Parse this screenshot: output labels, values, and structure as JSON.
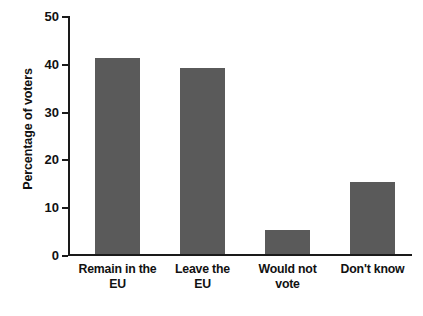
{
  "chart_data": {
    "type": "bar",
    "title": "",
    "xlabel": "",
    "ylabel": "Percentage of voters",
    "categories": [
      "Remain in the EU",
      "Leave the EU",
      "Would not vote",
      "Don't know"
    ],
    "category_lines": [
      [
        "Remain in the",
        "EU"
      ],
      [
        "Leave the",
        "EU"
      ],
      [
        "Would not",
        "vote"
      ],
      [
        "Don't know",
        ""
      ]
    ],
    "values": [
      41,
      39,
      5,
      15
    ],
    "ylim": [
      0,
      50
    ],
    "yticks": [
      0,
      10,
      20,
      30,
      40,
      50
    ],
    "ytick_labels": [
      "0",
      "10",
      "20",
      "30",
      "40",
      "50"
    ],
    "grid": false,
    "legend": false,
    "bar_color": "#5a5a5a",
    "axis_color": "#1a1a1a",
    "text_color": "#111111",
    "background": "#ffffff"
  }
}
